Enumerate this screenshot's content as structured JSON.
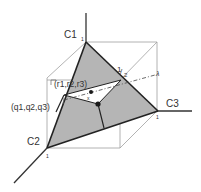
{
  "figure": {
    "colors": {
      "background": "#ffffff",
      "simplex_fill": "#b3b3b3",
      "inner_region_fill": "#ffffff",
      "axis_stroke": "#333333",
      "cube_stroke": "#9a9a9a",
      "point_fill": "#1a1a1a"
    }
  },
  "axes": {
    "c1": {
      "label": "C1",
      "tick": "1"
    },
    "c2": {
      "label": "C2",
      "tick": "1"
    },
    "c3": {
      "label": "C3",
      "tick": "1"
    }
  },
  "annotations": {
    "half_label": "1/2",
    "half_num": "1",
    "half_den": "2",
    "r_point": "(r1,r2,r3)",
    "q_point": "(q1,q2,q3)",
    "lambda_label": "λ",
    "x_label": "x"
  }
}
